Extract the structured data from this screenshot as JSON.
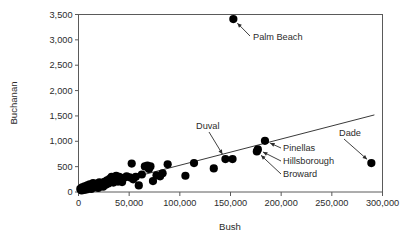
{
  "chart_data": {
    "type": "scatter",
    "title": "",
    "xlabel": "Bush",
    "ylabel": "Buchanan",
    "xlim": [
      0,
      300000
    ],
    "ylim": [
      0,
      3500
    ],
    "grid": false,
    "legend": "none",
    "xticks": [
      0,
      50000,
      100000,
      150000,
      200000,
      250000,
      300000
    ],
    "xtick_labels": [
      "0",
      "50,000",
      "100,000",
      "150,000",
      "200,000",
      "250,000",
      "300,000"
    ],
    "yticks": [
      0,
      500,
      1000,
      1500,
      2000,
      2500,
      3000,
      3500
    ],
    "ytick_labels": [
      "0",
      "500",
      "1,000",
      "1,500",
      "2,000",
      "2,500",
      "3,000",
      "3,500"
    ],
    "marker": {
      "shape": "circle",
      "color": "#000000",
      "size": 4.1
    },
    "trendline": {
      "type": "line",
      "color": "#3a3a3a",
      "x_start": 0,
      "y_start": 10,
      "x_end": 292000,
      "y_end": 1520
    },
    "points": [
      {
        "x": 1800,
        "y": 60
      },
      {
        "x": 2400,
        "y": 45
      },
      {
        "x": 3100,
        "y": 30
      },
      {
        "x": 3600,
        "y": 90
      },
      {
        "x": 4200,
        "y": 55
      },
      {
        "x": 4900,
        "y": 75
      },
      {
        "x": 5400,
        "y": 40
      },
      {
        "x": 6100,
        "y": 110
      },
      {
        "x": 6600,
        "y": 65
      },
      {
        "x": 7300,
        "y": 95
      },
      {
        "x": 8000,
        "y": 50
      },
      {
        "x": 8700,
        "y": 130
      },
      {
        "x": 9400,
        "y": 85
      },
      {
        "x": 10200,
        "y": 70
      },
      {
        "x": 11000,
        "y": 150
      },
      {
        "x": 11800,
        "y": 100
      },
      {
        "x": 12600,
        "y": 60
      },
      {
        "x": 13500,
        "y": 125
      },
      {
        "x": 14400,
        "y": 175
      },
      {
        "x": 15300,
        "y": 90
      },
      {
        "x": 16200,
        "y": 140
      },
      {
        "x": 17200,
        "y": 110
      },
      {
        "x": 18300,
        "y": 165
      },
      {
        "x": 19400,
        "y": 80
      },
      {
        "x": 20600,
        "y": 190
      },
      {
        "x": 21800,
        "y": 130
      },
      {
        "x": 23000,
        "y": 155
      },
      {
        "x": 24300,
        "y": 105
      },
      {
        "x": 25600,
        "y": 200
      },
      {
        "x": 26900,
        "y": 145
      },
      {
        "x": 28200,
        "y": 230
      },
      {
        "x": 29500,
        "y": 170
      },
      {
        "x": 30800,
        "y": 260
      },
      {
        "x": 31800,
        "y": 210
      },
      {
        "x": 32700,
        "y": 300
      },
      {
        "x": 33600,
        "y": 240
      },
      {
        "x": 34500,
        "y": 185
      },
      {
        "x": 35400,
        "y": 285
      },
      {
        "x": 36300,
        "y": 225
      },
      {
        "x": 37200,
        "y": 320
      },
      {
        "x": 38100,
        "y": 260
      },
      {
        "x": 39000,
        "y": 205
      },
      {
        "x": 40200,
        "y": 300
      },
      {
        "x": 41500,
        "y": 245
      },
      {
        "x": 43000,
        "y": 195
      },
      {
        "x": 45000,
        "y": 280
      },
      {
        "x": 47500,
        "y": 310
      },
      {
        "x": 50500,
        "y": 290
      },
      {
        "x": 52500,
        "y": 560
      },
      {
        "x": 54000,
        "y": 250
      },
      {
        "x": 56500,
        "y": 300
      },
      {
        "x": 59500,
        "y": 130
      },
      {
        "x": 62500,
        "y": 345
      },
      {
        "x": 65500,
        "y": 505
      },
      {
        "x": 68000,
        "y": 520
      },
      {
        "x": 69500,
        "y": 455
      },
      {
        "x": 71000,
        "y": 505
      },
      {
        "x": 73500,
        "y": 215
      },
      {
        "x": 77000,
        "y": 330
      },
      {
        "x": 80500,
        "y": 310
      },
      {
        "x": 83000,
        "y": 370
      },
      {
        "x": 88000,
        "y": 545
      },
      {
        "x": 105500,
        "y": 320
      },
      {
        "x": 114000,
        "y": 570
      },
      {
        "x": 133500,
        "y": 465
      },
      {
        "x": 152000,
        "y": 650
      },
      {
        "x": 152800,
        "y": 3410,
        "label": "Palm Beach"
      },
      {
        "x": 145000,
        "y": 650,
        "label": "Duval"
      },
      {
        "x": 176000,
        "y": 800,
        "label": "Broward"
      },
      {
        "x": 177000,
        "y": 840,
        "label": "Hillsborough"
      },
      {
        "x": 184000,
        "y": 1010,
        "label": "Pinellas"
      },
      {
        "x": 289000,
        "y": 570,
        "label": "Dade"
      }
    ],
    "annotations": [
      {
        "text": "Palm Beach",
        "target": "Palm Beach"
      },
      {
        "text": "Duval",
        "target": "Duval"
      },
      {
        "text": "Pinellas",
        "target": "Pinellas"
      },
      {
        "text": "Hillsborough",
        "target": "Hillsborough"
      },
      {
        "text": "Broward",
        "target": "Broward"
      },
      {
        "text": "Dade",
        "target": "Dade"
      }
    ]
  }
}
